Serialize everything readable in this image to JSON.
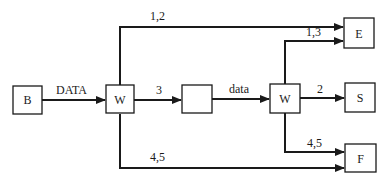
{
  "diagram": {
    "nodes": {
      "B": {
        "label": "B"
      },
      "W1": {
        "label": "W"
      },
      "blank": {
        "label": ""
      },
      "W2": {
        "label": "W"
      },
      "E": {
        "label": "E"
      },
      "S": {
        "label": "S"
      },
      "F": {
        "label": "F"
      }
    },
    "edges": {
      "b_w1": {
        "label": "DATA"
      },
      "w1_blank": {
        "label": "3"
      },
      "blank_w2": {
        "label": "data"
      },
      "w1_e": {
        "label": "1,2"
      },
      "w2_e": {
        "label": "1,3"
      },
      "w2_s": {
        "label": "2"
      },
      "w2_f": {
        "label": "4,5"
      },
      "w1_f": {
        "label": "4,5"
      }
    }
  }
}
